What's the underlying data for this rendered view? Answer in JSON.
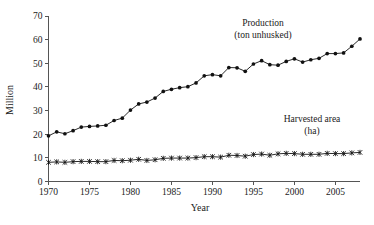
{
  "chart_data": {
    "type": "line",
    "title": "",
    "xlabel": "Year",
    "ylabel": "Million",
    "xlim": [
      1970,
      2008
    ],
    "ylim": [
      0,
      70
    ],
    "grid": false,
    "legend_position": "inline-annotations",
    "xticks": [
      1970,
      1975,
      1980,
      1985,
      1990,
      1995,
      2000,
      2005
    ],
    "xtick_labels": [
      "1970",
      "1975",
      "1980",
      "1985",
      "1990",
      "1995",
      "2000",
      "2005"
    ],
    "yticks": [
      0,
      10,
      20,
      30,
      40,
      50,
      60,
      70
    ],
    "ytick_labels": [
      "0",
      "10",
      "20",
      "30",
      "40",
      "50",
      "60",
      "70"
    ],
    "x": [
      1970,
      1971,
      1972,
      1973,
      1974,
      1975,
      1976,
      1977,
      1978,
      1979,
      1980,
      1981,
      1982,
      1983,
      1984,
      1985,
      1986,
      1987,
      1988,
      1989,
      1990,
      1991,
      1992,
      1993,
      1994,
      1995,
      1996,
      1997,
      1998,
      1999,
      2000,
      2001,
      2002,
      2003,
      2004,
      2005,
      2006,
      2007,
      2008
    ],
    "series": [
      {
        "name": "Production",
        "unit": "ton unhusked",
        "marker": "filled-circle",
        "values": [
          19.3,
          21.0,
          20.2,
          21.5,
          23.0,
          23.3,
          23.5,
          23.8,
          25.8,
          26.8,
          30.2,
          32.8,
          33.6,
          35.3,
          38.1,
          39.0,
          39.7,
          40.1,
          41.7,
          44.7,
          45.2,
          44.7,
          48.2,
          48.1,
          46.6,
          49.7,
          51.1,
          49.4,
          49.2,
          50.8,
          51.9,
          50.5,
          51.5,
          52.1,
          54.1,
          54.1,
          54.4,
          57.2,
          60.3
        ]
      },
      {
        "name": "Harvested area",
        "unit": "ha",
        "marker": "asterisk",
        "values": [
          8.1,
          8.3,
          8.1,
          8.4,
          8.5,
          8.5,
          8.4,
          8.4,
          8.9,
          8.8,
          9.0,
          9.4,
          8.9,
          9.2,
          9.8,
          9.9,
          9.9,
          9.9,
          10.1,
          10.5,
          10.5,
          10.3,
          11.1,
          11.0,
          10.7,
          11.4,
          11.6,
          11.1,
          11.7,
          11.9,
          11.8,
          11.5,
          11.5,
          11.5,
          11.9,
          11.8,
          11.8,
          12.1,
          12.3
        ]
      }
    ],
    "annotations": [
      {
        "id": "production-label",
        "line1": "Production",
        "line2": "(ton unhusked)"
      },
      {
        "id": "harvested-area-label",
        "line1": "Harvested area",
        "line2": "(ha)"
      }
    ]
  },
  "colors": {
    "ink": "#111111",
    "axis": "#555555",
    "background": "#ffffff"
  }
}
